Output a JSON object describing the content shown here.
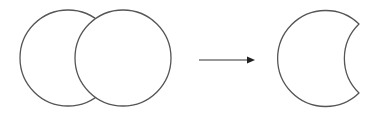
{
  "diagram": {
    "stroke_color": "#555555",
    "fill_color": "#ffffff",
    "steps": [
      {
        "label": "overlapping-circles"
      },
      {
        "label": "arrow"
      },
      {
        "label": "crescent-result"
      }
    ]
  }
}
